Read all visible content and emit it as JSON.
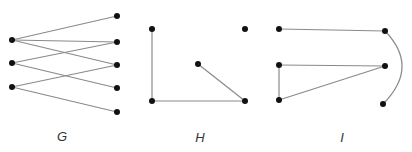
{
  "colors": {
    "edge": "#8a8a8a",
    "node": "#111111",
    "label": "#333333",
    "background": "#ffffff"
  },
  "graphs": [
    {
      "label": "G",
      "label_pos": [
        62,
        136
      ],
      "nodes": [
        [
          12,
          40
        ],
        [
          12,
          63
        ],
        [
          12,
          87
        ],
        [
          117,
          16
        ],
        [
          117,
          42
        ],
        [
          117,
          65
        ],
        [
          117,
          88
        ],
        [
          117,
          112
        ]
      ],
      "edges": [
        [
          0,
          3
        ],
        [
          0,
          4
        ],
        [
          0,
          5
        ],
        [
          1,
          4
        ],
        [
          1,
          6
        ],
        [
          2,
          5
        ],
        [
          2,
          7
        ]
      ],
      "arcs": []
    },
    {
      "label": "H",
      "label_pos": [
        200,
        137
      ],
      "nodes": [
        [
          152,
          29
        ],
        [
          245,
          29
        ],
        [
          198,
          64
        ],
        [
          152,
          101
        ],
        [
          245,
          101
        ]
      ],
      "edges": [
        [
          0,
          3
        ],
        [
          3,
          4
        ],
        [
          2,
          4
        ]
      ],
      "arcs": []
    },
    {
      "label": "I",
      "label_pos": [
        342,
        137
      ],
      "nodes": [
        [
          279,
          29
        ],
        [
          385,
          31
        ],
        [
          279,
          65
        ],
        [
          385,
          66
        ],
        [
          279,
          100
        ],
        [
          383,
          104
        ]
      ],
      "edges": [
        [
          0,
          1
        ],
        [
          2,
          3
        ],
        [
          2,
          4
        ],
        [
          4,
          3
        ]
      ],
      "arcs": [
        {
          "from": 1,
          "to": 5,
          "path": "M385,31 Q420,67 383,104"
        }
      ]
    }
  ]
}
